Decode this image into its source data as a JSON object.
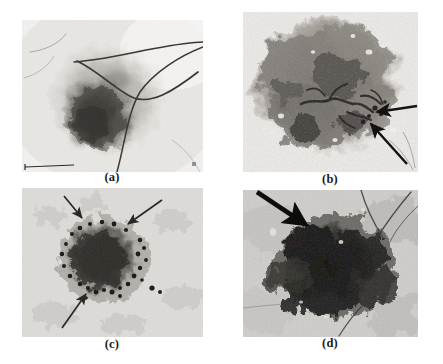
{
  "figure": {
    "type": "multi-panel-micrograph-figure",
    "background_color": "#ffffff",
    "layout": "2x2 grid",
    "panel_count": 4
  },
  "panels": [
    {
      "id": "a",
      "label": "(a)",
      "description": "Dermoscopy image of a pigmented skin lesion with a dark irregular central blotch and several dark terminal hairs crossing the field of view",
      "modality": "grayscale dermoscopy photograph",
      "tone": {
        "background_skin": "#efeeec",
        "lesion_mid": "#9a968f",
        "lesion_dark": "#3f3b37"
      },
      "annotations": [],
      "features": [
        "crossing hair strands",
        "asymmetric pigment network",
        "dark central blotch"
      ]
    },
    {
      "id": "b",
      "label": "(b)",
      "description": "Dermoscopy image with a broad diffuse pigmented lesion showing a branched dark streak structure at centre-right indicated by two arrows",
      "modality": "grayscale dermoscopy photograph",
      "tone": {
        "background_skin": "#e6e4e1",
        "lesion_mid": "#8b8782",
        "lesion_dark": "#2e2b28"
      },
      "annotations": [
        {
          "type": "arrow",
          "index": 1,
          "direction": "pointing left",
          "target": "branched dark streak / vascular structure"
        },
        {
          "type": "arrow",
          "index": 2,
          "direction": "pointing up-left",
          "target": "branched dark streak / vascular structure"
        }
      ],
      "features": [
        "irregular border",
        "branched streaks",
        "blue-white veil"
      ]
    },
    {
      "id": "c",
      "label": "(c)",
      "description": "Dermoscopy image of a round darkly pigmented lesion on light skin with peripheral dotted globules marked by three arrows",
      "modality": "grayscale dermoscopy photograph",
      "tone": {
        "background_skin": "#d8d7d4",
        "lesion_mid": "#7d7a75",
        "lesion_dark": "#2a2725"
      },
      "annotations": [
        {
          "type": "arrow",
          "index": 1,
          "direction": "pointing down-right",
          "target": "peripheral dots at upper-left margin"
        },
        {
          "type": "arrow",
          "index": 2,
          "direction": "pointing down-left",
          "target": "peripheral dots at upper-right margin"
        },
        {
          "type": "arrow",
          "index": 3,
          "direction": "pointing up-right",
          "target": "peripheral dots at lower margin"
        }
      ],
      "features": [
        "radial streaming",
        "peripheral dots and globules",
        "sharply demarcated border"
      ]
    },
    {
      "id": "d",
      "label": "(d)",
      "description": "High-contrast dermoscopy image of a large very dark irregular lesion with hair strands, a thick arrow points to the upper-left lesion edge",
      "modality": "grayscale dermoscopy photograph",
      "tone": {
        "background_skin": "#cfcdc9",
        "lesion_mid": "#5e5b57",
        "lesion_dark": "#141312"
      },
      "annotations": [
        {
          "type": "arrow",
          "index": 1,
          "direction": "pointing down-right",
          "style": "thick",
          "target": "regression / scar-like depigmented area at lesion edge"
        }
      ],
      "features": [
        "blotchy heavy pigmentation",
        "hair strands",
        "irregular extensions"
      ]
    }
  ],
  "colors": {
    "page_background": "#ffffff",
    "label_text": "#1b1b1b",
    "arrow_stroke": "#171717"
  }
}
